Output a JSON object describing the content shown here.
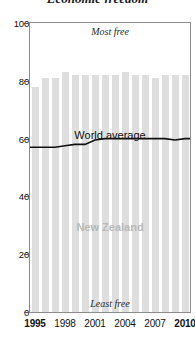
{
  "chart_data": {
    "type": "bar",
    "title": "Economic freedom",
    "xlabel": "",
    "ylabel": "",
    "ylim": [
      0,
      100
    ],
    "yticks": [
      0,
      20,
      40,
      60,
      80,
      100
    ],
    "grid": false,
    "legend_position": "inline-annotations",
    "categories": [
      1995,
      1996,
      1997,
      1998,
      1999,
      2000,
      2001,
      2002,
      2003,
      2004,
      2005,
      2006,
      2007,
      2008,
      2009,
      2010
    ],
    "xtick_labels": [
      "1995",
      "1998",
      "2001",
      "2004",
      "2007",
      "2010"
    ],
    "xtick_values": [
      1995,
      1998,
      2001,
      2004,
      2007,
      2010
    ],
    "series": [
      {
        "name": "New Zealand",
        "kind": "bar",
        "color": "#dedede",
        "values": [
          78,
          81,
          81,
          83,
          82,
          82,
          82,
          82,
          82,
          83,
          82,
          82,
          81,
          82,
          82,
          82
        ]
      },
      {
        "name": "World average",
        "kind": "line",
        "color": "#111111",
        "values": [
          57,
          57,
          57,
          57.5,
          58,
          58,
          59.5,
          60,
          60,
          60,
          60,
          60,
          60,
          60,
          59.5,
          60
        ]
      }
    ],
    "annotations": [
      {
        "text": "Most free",
        "position": "top-center"
      },
      {
        "text": "Least free",
        "position": "bottom-center"
      },
      {
        "text": "World average",
        "position": "mid-center"
      },
      {
        "text": "New Zealand",
        "position": "lower-center"
      }
    ],
    "colors": {
      "bar": "#dedede",
      "line": "#111111",
      "frame": "#8c8c8c",
      "nz_label": "#b9b9b9",
      "text": "#111111"
    }
  },
  "axis": {
    "y_labels": [
      "100",
      "80",
      "60",
      "40",
      "20",
      "0"
    ],
    "y_values": [
      100,
      80,
      60,
      40,
      20,
      0
    ],
    "x_labels": [
      "1995",
      "1998",
      "2001",
      "2004",
      "2007",
      "2010"
    ],
    "x_bold": [
      true,
      false,
      false,
      false,
      false,
      true
    ]
  },
  "labels": {
    "most_free": "Most free",
    "least_free": "Least free",
    "world_average": "World average",
    "new_zealand": "New Zealand",
    "title_fragment": "Economic freedom"
  }
}
